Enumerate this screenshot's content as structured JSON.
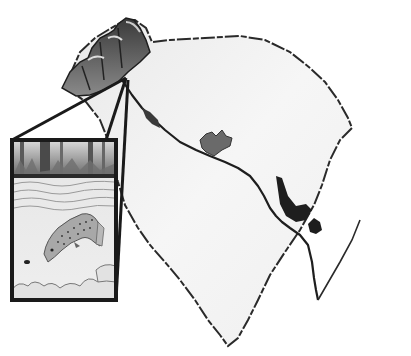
{
  "illustration": {
    "subject": "Map of South Carolina with inset of trout in a river",
    "top_caption_cutoff": "",
    "colors": {
      "background": "#ffffff",
      "state_fill": "#f1f1f1",
      "state_outline": "#2a2a2a",
      "mountains": "#5a5a5a",
      "river": "#1e1e1e",
      "inset_frame": "#1a1a1a",
      "water": "#e6e6e6",
      "trout": "#9a9a9a"
    },
    "map": {
      "label": "south-carolina-map",
      "features": [
        "mountain-region",
        "river",
        "lake-1",
        "lake-2",
        "lake-3"
      ]
    },
    "inset": {
      "label": "trout-inset",
      "elements": [
        "tree-line",
        "water-surface",
        "trout",
        "fly-lure",
        "river-rocks"
      ]
    }
  }
}
